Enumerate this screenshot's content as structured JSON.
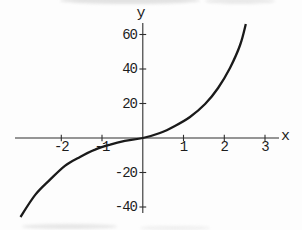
{
  "chart_data": {
    "type": "line",
    "title": "",
    "xlabel": "x",
    "ylabel": "y",
    "x_ticks": [
      -2,
      -1,
      1,
      2,
      3
    ],
    "y_ticks": [
      60,
      40,
      20,
      -20,
      -40
    ],
    "x_range": [
      -3.1,
      3.3
    ],
    "y_range": [
      -46,
      67
    ],
    "grid": false,
    "legend": null,
    "background_color": "#fdfdfd",
    "axis_color": "#2e2e2e",
    "curve_color": "#1a1a1a",
    "label_color": "#1d1d1d",
    "points": [
      [
        -3.0,
        -45.8
      ],
      [
        -2.64,
        -33.0
      ],
      [
        -2.28,
        -24.3
      ],
      [
        -1.91,
        -16.2
      ],
      [
        -1.54,
        -11.0
      ],
      [
        -1.17,
        -6.7
      ],
      [
        -0.8,
        -3.8
      ],
      [
        -0.44,
        -1.7
      ],
      [
        0.0,
        0.0
      ],
      [
        0.42,
        2.9
      ],
      [
        0.79,
        7.0
      ],
      [
        1.16,
        12.2
      ],
      [
        1.53,
        19.7
      ],
      [
        1.85,
        29.0
      ],
      [
        2.14,
        40.6
      ],
      [
        2.39,
        53.9
      ],
      [
        2.53,
        66.1
      ]
    ]
  }
}
